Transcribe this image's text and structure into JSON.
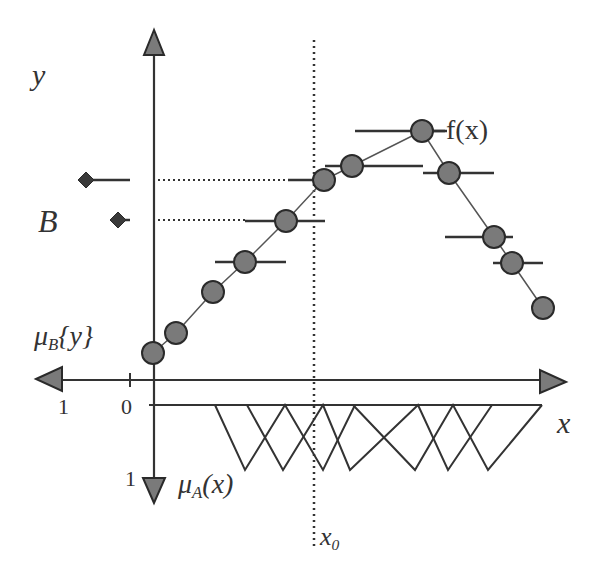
{
  "colors": {
    "ink": "#333333",
    "marker_fill": "#7a7a7a",
    "marker_stroke": "#2a2a2a",
    "background": "#ffffff"
  },
  "labels": {
    "y_axis": "y",
    "fuzzy_output_set": "B",
    "output_membership_main": "μ",
    "output_membership_sub": "B",
    "output_membership_arg": "{y}",
    "input_membership_main": "μ",
    "input_membership_sub": "A",
    "input_membership_arg": "(x)",
    "x_axis": "x",
    "function": "f(x)",
    "x0_main": "x",
    "x0_sub": "0",
    "left_tick_1": "1",
    "left_tick_0": "0",
    "down_tick_1": "1"
  },
  "diagram": {
    "axes": {
      "y_axis_x": 154,
      "x_axis_y": 380,
      "membership_baseline_y": 405,
      "membership_peak_y": 470,
      "x0_position": 314
    },
    "samples": [
      {
        "x": 153,
        "y": 353
      },
      {
        "x": 176,
        "y": 333
      },
      {
        "x": 213,
        "y": 292
      },
      {
        "x": 245,
        "y": 262,
        "bar": [
          215,
          286
        ]
      },
      {
        "x": 286,
        "y": 221,
        "bar": [
          245,
          325
        ]
      },
      {
        "x": 324,
        "y": 180,
        "bar": [
          288,
          325
        ]
      },
      {
        "x": 352,
        "y": 166,
        "bar": [
          325,
          423
        ]
      },
      {
        "x": 422,
        "y": 131,
        "bar": [
          355,
          445
        ]
      },
      {
        "x": 449,
        "y": 173,
        "bar": [
          423,
          494
        ]
      },
      {
        "x": 494,
        "y": 237,
        "bar": [
          445,
          513
        ]
      },
      {
        "x": 512,
        "y": 263,
        "bar": [
          493,
          543
        ]
      },
      {
        "x": 543,
        "y": 308
      }
    ],
    "output_memberships": [
      {
        "y": 180,
        "diamond_x": 86,
        "line_to": 130,
        "dotted_to": 288
      },
      {
        "y": 220,
        "diamond_x": 118,
        "line_to": 130,
        "dotted_to": 246
      }
    ],
    "input_membership_chains": [
      [
        [
          215,
          405
        ],
        [
          245,
          470
        ],
        [
          285,
          405
        ],
        [
          323,
          470
        ],
        [
          355,
          405
        ]
      ],
      [
        [
          247,
          405
        ],
        [
          283,
          470
        ],
        [
          323,
          405
        ],
        [
          350,
          470
        ],
        [
          418,
          405
        ],
        [
          448,
          470
        ],
        [
          492,
          405
        ]
      ],
      [
        [
          353,
          405
        ],
        [
          415,
          470
        ],
        [
          453,
          405
        ],
        [
          488,
          470
        ],
        [
          542,
          405
        ]
      ]
    ]
  }
}
